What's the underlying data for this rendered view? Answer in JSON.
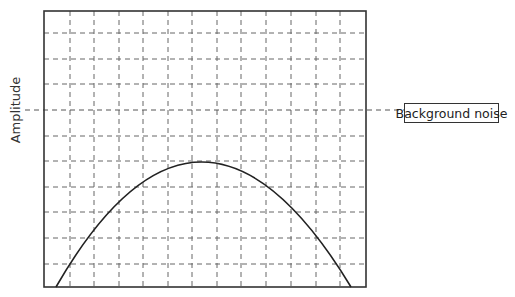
{
  "diagram": {
    "y_axis_label": "Amplitude",
    "annotation": "Background noise",
    "grid": {
      "columns": 13,
      "rows": 11,
      "style": "dashed"
    },
    "curve": {
      "shape": "inverted parabola",
      "start_x": 56,
      "end_x": 351,
      "peak_x": 200,
      "peak_y": 162
    },
    "noise_level_row": 4
  },
  "colors": {
    "frame": "#333333",
    "grid": "#555555",
    "curve": "#222222"
  }
}
